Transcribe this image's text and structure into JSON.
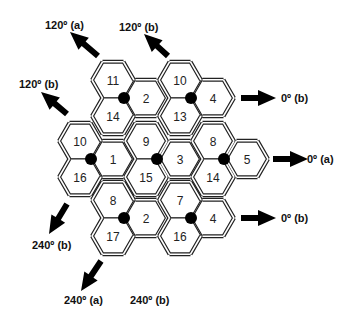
{
  "diagram": {
    "type": "hexagonal cell reuse pattern with sectorized antennas",
    "hex_radius": 21,
    "colors": {
      "stroke": "#222222",
      "dot": "#000000",
      "background": "#ffffff"
    },
    "cells": [
      {
        "id": "c11",
        "label": "11",
        "cx": 113,
        "cy": 80,
        "cluster": "A"
      },
      {
        "id": "c14a",
        "label": "14",
        "cx": 113,
        "cy": 116,
        "cluster": "A"
      },
      {
        "id": "c2a",
        "label": "2",
        "cx": 146,
        "cy": 98,
        "cluster": "A"
      },
      {
        "id": "c10a",
        "label": "10",
        "cx": 180,
        "cy": 80,
        "cluster": "B"
      },
      {
        "id": "c13",
        "label": "13",
        "cx": 180,
        "cy": 116,
        "cluster": "B"
      },
      {
        "id": "c4a",
        "label": "4",
        "cx": 213,
        "cy": 98,
        "cluster": "B"
      },
      {
        "id": "c10b",
        "label": "10",
        "cx": 80,
        "cy": 141,
        "cluster": "C"
      },
      {
        "id": "c16a",
        "label": "16",
        "cx": 80,
        "cy": 177,
        "cluster": "C"
      },
      {
        "id": "c1",
        "label": "1",
        "cx": 113,
        "cy": 159,
        "cluster": "C"
      },
      {
        "id": "c9",
        "label": "9",
        "cx": 146,
        "cy": 141,
        "cluster": "D"
      },
      {
        "id": "c15",
        "label": "15",
        "cx": 146,
        "cy": 177,
        "cluster": "D"
      },
      {
        "id": "c3",
        "label": "3",
        "cx": 180,
        "cy": 159,
        "cluster": "D"
      },
      {
        "id": "c8a",
        "label": "8",
        "cx": 213,
        "cy": 141,
        "cluster": "E"
      },
      {
        "id": "c14b",
        "label": "14",
        "cx": 213,
        "cy": 177,
        "cluster": "E"
      },
      {
        "id": "c5",
        "label": "5",
        "cx": 247,
        "cy": 159,
        "cluster": "E"
      },
      {
        "id": "c8b",
        "label": "8",
        "cx": 113,
        "cy": 200,
        "cluster": "F"
      },
      {
        "id": "c17",
        "label": "17",
        "cx": 113,
        "cy": 236,
        "cluster": "F"
      },
      {
        "id": "c2b",
        "label": "2",
        "cx": 146,
        "cy": 218,
        "cluster": "F"
      },
      {
        "id": "c7",
        "label": "7",
        "cx": 180,
        "cy": 200,
        "cluster": "G"
      },
      {
        "id": "c16b",
        "label": "16",
        "cx": 180,
        "cy": 236,
        "cluster": "G"
      },
      {
        "id": "c4b",
        "label": "4",
        "cx": 213,
        "cy": 218,
        "cluster": "G"
      }
    ],
    "sites": [
      {
        "cluster": "A",
        "x": 124,
        "y": 98
      },
      {
        "cluster": "B",
        "x": 191,
        "y": 98
      },
      {
        "cluster": "C",
        "x": 91,
        "y": 159
      },
      {
        "cluster": "D",
        "x": 157,
        "y": 159
      },
      {
        "cluster": "E",
        "x": 224,
        "y": 159
      },
      {
        "cluster": "F",
        "x": 124,
        "y": 218
      },
      {
        "cluster": "G",
        "x": 191,
        "y": 218
      }
    ],
    "direction_labels": [
      {
        "id": "lbl-120a-top",
        "text": "120º (a)",
        "x": 45,
        "y": 29
      },
      {
        "id": "lbl-120b-top",
        "text": "120º (b)",
        "x": 119,
        "y": 31
      },
      {
        "id": "lbl-120b-left",
        "text": "120º (b)",
        "x": 19,
        "y": 88
      },
      {
        "id": "lbl-0b-top",
        "text": "0º (b)",
        "x": 281,
        "y": 102
      },
      {
        "id": "lbl-0a",
        "text": "0º (a)",
        "x": 307,
        "y": 163
      },
      {
        "id": "lbl-0b-bottom",
        "text": "0º (b)",
        "x": 281,
        "y": 222
      },
      {
        "id": "lbl-240b-left",
        "text": "240º (b)",
        "x": 32,
        "y": 249
      },
      {
        "id": "lbl-240a",
        "text": "240º (a)",
        "x": 64,
        "y": 304
      },
      {
        "id": "lbl-240b-bot",
        "text": "240º (b)",
        "x": 130,
        "y": 304
      }
    ],
    "arrows": [
      {
        "id": "arrow-120a-top",
        "direction": "120",
        "x1": 98,
        "y1": 56,
        "x2": 70,
        "y2": 32
      },
      {
        "id": "arrow-120b-top",
        "direction": "120",
        "x1": 168,
        "y1": 56,
        "x2": 144,
        "y2": 34
      },
      {
        "id": "arrow-120b-left",
        "direction": "120",
        "x1": 67,
        "y1": 114,
        "x2": 41,
        "y2": 92
      },
      {
        "id": "arrow-0b-top",
        "direction": "0",
        "x1": 241,
        "y1": 98,
        "x2": 276,
        "y2": 98
      },
      {
        "id": "arrow-0a",
        "direction": "0",
        "x1": 273,
        "y1": 159,
        "x2": 308,
        "y2": 159
      },
      {
        "id": "arrow-0b-bottom",
        "direction": "0",
        "x1": 241,
        "y1": 218,
        "x2": 276,
        "y2": 218
      },
      {
        "id": "arrow-240b-left",
        "direction": "240",
        "x1": 67,
        "y1": 204,
        "x2": 49,
        "y2": 234
      },
      {
        "id": "arrow-240a",
        "direction": "240",
        "x1": 101,
        "y1": 261,
        "x2": 81,
        "y2": 291
      }
    ]
  }
}
